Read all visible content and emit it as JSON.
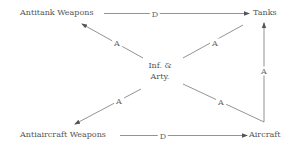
{
  "diagram": {
    "nodes": {
      "antitank": "Antitank Weapons",
      "tanks": "Tanks",
      "center_line1": "Inf. &",
      "center_line2": "Arty.",
      "antiaircraft": "Antiaircraft Weapons",
      "aircraft": "Aircraft"
    },
    "edges": {
      "antitank_to_tanks": "D",
      "center_to_antitank": "A",
      "center_to_tanks": "A",
      "center_to_antiaircraft": "A",
      "center_to_aircraft": "A",
      "aircraft_to_tanks": "A",
      "antiaircraft_to_aircraft": "D"
    },
    "colors": {
      "line": "#666666",
      "text": "#555555",
      "background": "#ffffff"
    }
  }
}
